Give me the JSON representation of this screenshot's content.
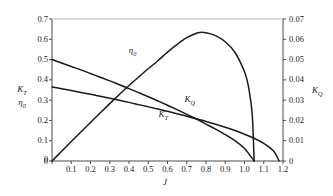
{
  "chart_data": {
    "type": "line",
    "title": "",
    "xlabel": "J",
    "ylabel_left_line1": "K",
    "ylabel_left_line1_sub": "T",
    "ylabel_left_line2": "η",
    "ylabel_left_line2_sub": "0",
    "ylabel_right": "K",
    "ylabel_right_sub": "Q",
    "xlim": [
      0,
      1.2
    ],
    "ylim_left": [
      0,
      0.7
    ],
    "ylim_right": [
      0,
      0.07
    ],
    "grid": false,
    "legend": "inline-curve-labels",
    "xticks": [
      "0",
      "0.1",
      "0.2",
      "0.3",
      "0.4",
      "0.5",
      "0.6",
      "0.7",
      "0.8",
      "0.9",
      "1.0",
      "1.1",
      "1.2"
    ],
    "xtick_values": [
      0,
      0.1,
      0.2,
      0.3,
      0.4,
      0.5,
      0.6,
      0.7,
      0.8,
      0.9,
      1.0,
      1.1,
      1.2
    ],
    "yticks_left": [
      "0",
      "0.1",
      "0.2",
      "0.3",
      "0.4",
      "0.5",
      "0.6",
      "0.7"
    ],
    "ytick_left_values": [
      0,
      0.1,
      0.2,
      0.3,
      0.4,
      0.5,
      0.6,
      0.7
    ],
    "yticks_right": [
      "0",
      "0.01",
      "0.02",
      "0.03",
      "0.04",
      "0.05",
      "0.06",
      "0.07"
    ],
    "ytick_right_values": [
      0,
      0.01,
      0.02,
      0.03,
      0.04,
      0.05,
      0.06,
      0.07
    ],
    "series": [
      {
        "name": "K_T",
        "label": "K",
        "label_sub": "T",
        "axis": "left",
        "color": "#1a1a1a",
        "label_x": 0.585,
        "label_y": 0.228,
        "x": [
          0.0,
          0.05,
          0.1,
          0.15,
          0.2,
          0.25,
          0.3,
          0.35,
          0.4,
          0.45,
          0.5,
          0.55,
          0.6,
          0.65,
          0.7,
          0.75,
          0.8,
          0.85,
          0.9,
          0.95,
          1.0,
          1.05
        ],
        "values": [
          0.5,
          0.483,
          0.466,
          0.449,
          0.431,
          0.413,
          0.395,
          0.376,
          0.357,
          0.337,
          0.317,
          0.296,
          0.275,
          0.253,
          0.23,
          0.207,
          0.182,
          0.157,
          0.13,
          0.1,
          0.062,
          0.0
        ]
      },
      {
        "name": "K_Q",
        "label": "K",
        "label_sub": "Q",
        "axis": "right",
        "color": "#1a1a1a",
        "label_x": 0.72,
        "label_y": 0.03,
        "x": [
          0.0,
          0.05,
          0.1,
          0.15,
          0.2,
          0.25,
          0.3,
          0.35,
          0.4,
          0.45,
          0.5,
          0.55,
          0.6,
          0.65,
          0.7,
          0.75,
          0.8,
          0.85,
          0.9,
          0.95,
          1.0,
          1.05,
          1.1,
          1.15,
          1.18
        ],
        "values": [
          0.0365,
          0.0356,
          0.0347,
          0.0338,
          0.0329,
          0.0319,
          0.0309,
          0.0299,
          0.0289,
          0.0278,
          0.0267,
          0.0256,
          0.0245,
          0.0233,
          0.0221,
          0.0208,
          0.0195,
          0.0181,
          0.0166,
          0.015,
          0.0132,
          0.0112,
          0.0087,
          0.005,
          0.0
        ]
      },
      {
        "name": "eta_0",
        "label": "η",
        "label_sub": "0",
        "axis": "left",
        "color": "#1a1a1a",
        "label_x": 0.43,
        "label_y": 0.54,
        "x": [
          0.0,
          0.05,
          0.1,
          0.15,
          0.2,
          0.25,
          0.3,
          0.35,
          0.4,
          0.45,
          0.5,
          0.55,
          0.6,
          0.65,
          0.7,
          0.75,
          0.77,
          0.8,
          0.85,
          0.9,
          0.95,
          1.0,
          1.02,
          1.04,
          1.05
        ],
        "values": [
          0.0,
          0.048,
          0.096,
          0.143,
          0.19,
          0.237,
          0.283,
          0.328,
          0.372,
          0.414,
          0.455,
          0.494,
          0.537,
          0.575,
          0.608,
          0.63,
          0.634,
          0.632,
          0.618,
          0.588,
          0.536,
          0.44,
          0.37,
          0.23,
          0.0
        ]
      }
    ]
  },
  "axes": {
    "x_axis_name": "J",
    "left_axis_name": "K_T / eta_0",
    "right_axis_name": "K_Q"
  }
}
